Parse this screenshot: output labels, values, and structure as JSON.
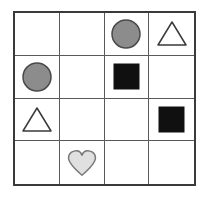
{
  "figure": {
    "name": "shape-grid",
    "background_color": "#ffffff",
    "rows": 4,
    "columns": 4
  },
  "grid_style": {
    "outer_border_color": "#3a3a3a",
    "outer_border_width_px": 2,
    "inner_line_color": "#595959",
    "inner_line_width_px": 1,
    "cell_fill": "#ffffff"
  },
  "palette": {
    "gray_fill": "#8c8c8c",
    "gray_stroke": "#4a4a4a",
    "black_fill": "#101010",
    "white_fill": "#ffffff",
    "dark_stroke": "#3a3a3a",
    "light_gray_fill": "#e0e0e0",
    "light_gray_stroke": "#7a7a7a"
  },
  "cells": [
    {
      "row": 1,
      "col": 1,
      "shape": "none",
      "label": "empty-cell",
      "fill": "",
      "stroke": ""
    },
    {
      "row": 1,
      "col": 2,
      "shape": "none",
      "label": "empty-cell",
      "fill": "",
      "stroke": ""
    },
    {
      "row": 1,
      "col": 3,
      "shape": "circle",
      "label": "gray-circle",
      "fill": "#8c8c8c",
      "stroke": "#4a4a4a"
    },
    {
      "row": 1,
      "col": 4,
      "shape": "triangle",
      "label": "white-triangle",
      "fill": "#ffffff",
      "stroke": "#3a3a3a"
    },
    {
      "row": 2,
      "col": 1,
      "shape": "circle",
      "label": "gray-circle",
      "fill": "#8c8c8c",
      "stroke": "#4a4a4a"
    },
    {
      "row": 2,
      "col": 2,
      "shape": "none",
      "label": "empty-cell",
      "fill": "",
      "stroke": ""
    },
    {
      "row": 2,
      "col": 3,
      "shape": "square",
      "label": "black-square",
      "fill": "#101010",
      "stroke": "#101010"
    },
    {
      "row": 2,
      "col": 4,
      "shape": "none",
      "label": "empty-cell",
      "fill": "",
      "stroke": ""
    },
    {
      "row": 3,
      "col": 1,
      "shape": "triangle",
      "label": "white-triangle",
      "fill": "#ffffff",
      "stroke": "#3a3a3a"
    },
    {
      "row": 3,
      "col": 2,
      "shape": "none",
      "label": "empty-cell",
      "fill": "",
      "stroke": ""
    },
    {
      "row": 3,
      "col": 3,
      "shape": "none",
      "label": "empty-cell",
      "fill": "",
      "stroke": ""
    },
    {
      "row": 3,
      "col": 4,
      "shape": "square",
      "label": "black-square",
      "fill": "#101010",
      "stroke": "#101010"
    },
    {
      "row": 4,
      "col": 1,
      "shape": "none",
      "label": "empty-cell",
      "fill": "",
      "stroke": ""
    },
    {
      "row": 4,
      "col": 2,
      "shape": "heart",
      "label": "light-gray-heart",
      "fill": "#e0e0e0",
      "stroke": "#7a7a7a"
    },
    {
      "row": 4,
      "col": 3,
      "shape": "none",
      "label": "empty-cell",
      "fill": "",
      "stroke": ""
    },
    {
      "row": 4,
      "col": 4,
      "shape": "none",
      "label": "empty-cell",
      "fill": "",
      "stroke": ""
    }
  ],
  "shape_geometry": {
    "circle_diameter_px": 30,
    "triangle_width_px": 30,
    "triangle_height_px": 25,
    "square_size_px": 25,
    "heart_width_px": 28,
    "heart_height_px": 26
  }
}
